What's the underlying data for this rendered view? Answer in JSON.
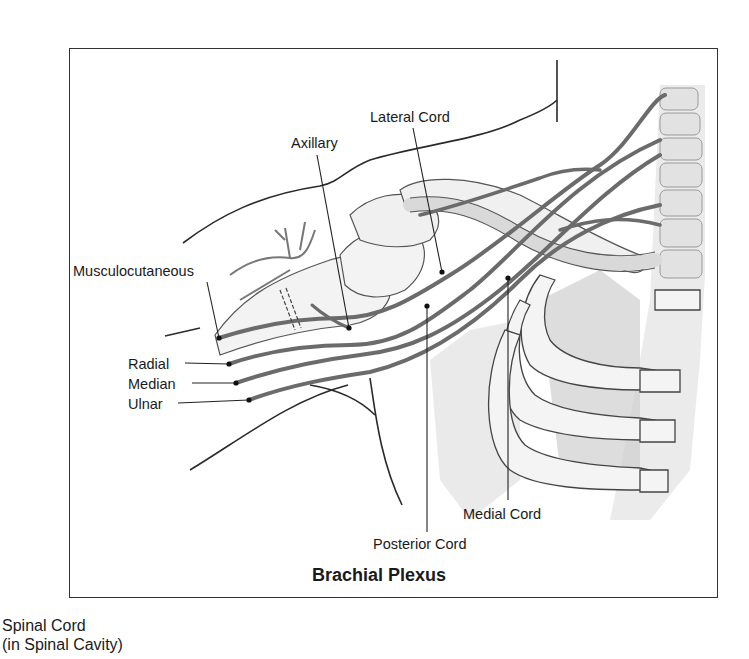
{
  "figure": {
    "title": "Brachial Plexus",
    "labels": {
      "musculocutaneous": "Musculocutaneous",
      "axillary": "Axillary",
      "lateral_cord": "Lateral Cord",
      "radial": "Radial",
      "median": "Median",
      "ulnar": "Ulnar",
      "medial_cord": "Medial Cord",
      "posterior_cord": "Posterior Cord"
    }
  },
  "caption": {
    "line1": "Spinal Cord",
    "line2": "(in Spinal Cavity)"
  },
  "colors": {
    "nerve": "#6b6b6b",
    "outline": "#2a2a2a",
    "bone_fill": "#eeeeee",
    "shadow": "#b5b5b5"
  }
}
